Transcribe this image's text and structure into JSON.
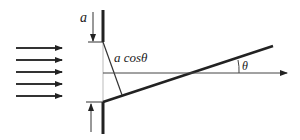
{
  "diagram": {
    "labels": {
      "slit_width": "a",
      "projected_width": "a cosθ",
      "angle": "θ"
    },
    "colors": {
      "line": "#222222",
      "thin_line": "#444444",
      "background": "#ffffff"
    },
    "incident_arrows": {
      "count": 5,
      "y_positions": [
        48,
        60,
        72,
        84,
        96
      ],
      "x_start": 16,
      "x_end": 62
    }
  }
}
